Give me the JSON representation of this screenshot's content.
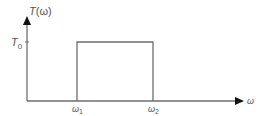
{
  "diagram": {
    "type": "rectangular-pulse-function-plot",
    "y_axis": {
      "label": "T(ω)",
      "label_main": "T",
      "label_arg": "(ω)"
    },
    "x_axis": {
      "label": "ω"
    },
    "y_tick": {
      "label_main": "T",
      "label_sub": "0"
    },
    "x_ticks": [
      {
        "label_main": "ω",
        "label_sub": "1"
      },
      {
        "label_main": "ω",
        "label_sub": "2"
      }
    ],
    "pulse": {
      "from": "ω₁",
      "to": "ω₂",
      "height": "T₀"
    },
    "colors": {
      "line": "#6e6e6e",
      "arrow": "#111111",
      "text": "#555555"
    }
  }
}
